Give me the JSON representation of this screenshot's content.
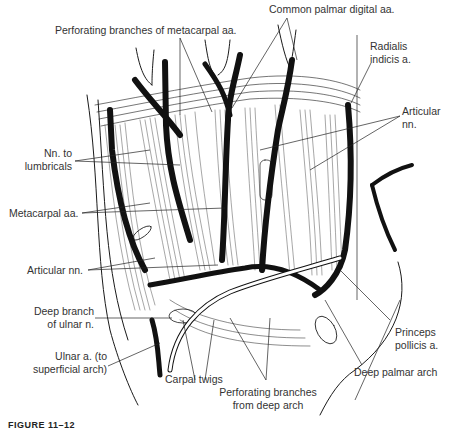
{
  "figure": {
    "caption": "FIGURE 11–12"
  },
  "labels": {
    "perforating_metacarpal": "Perforating branches of metacarpal aa.",
    "common_palmar_digital": "Common palmar digital aa.",
    "radialis_indicis_1": "Radialis",
    "radialis_indicis_2": "indicis a.",
    "articular_nn_right_1": "Articular",
    "articular_nn_right_2": "nn.",
    "nn_lumbricals_1": "Nn. to",
    "nn_lumbricals_2": "lumbricals",
    "metacarpal_aa": "Metacarpal aa.",
    "articular_nn_left": "Articular nn.",
    "deep_branch_ulnar_1": "Deep branch",
    "deep_branch_ulnar_2": "of ulnar n.",
    "ulnar_a_1": "Ulnar a. (to",
    "ulnar_a_2": "superficial arch)",
    "carpal_twigs": "Carpal twigs",
    "perforating_deep_1": "Perforating branches",
    "perforating_deep_2": "from deep arch",
    "princeps_pollicis_1": "Princeps",
    "princeps_pollicis_2": "pollicis a.",
    "deep_palmar_arch": "Deep palmar arch"
  },
  "colors": {
    "ink": "#1a1a1a",
    "label": "#333333",
    "background": "#ffffff"
  }
}
